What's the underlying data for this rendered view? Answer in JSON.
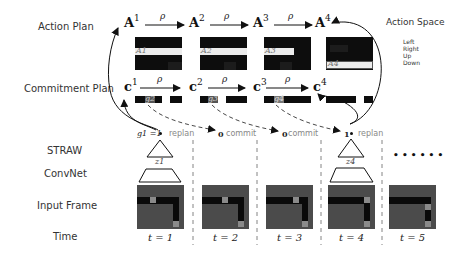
{
  "row_labels": {
    "action_plan": "Action Plan",
    "commitment_plan": "Commitment Plan",
    "straw": "STRAW",
    "convnet": "ConvNet",
    "input_frame": "Input Frame",
    "time": "Time"
  },
  "action_plan": {
    "nodes": [
      {
        "symbol": "A",
        "sup": "1",
        "block_label": "A1"
      },
      {
        "symbol": "A",
        "sup": "2",
        "block_label": "A2"
      },
      {
        "symbol": "A",
        "sup": "3",
        "block_label": "A3"
      },
      {
        "symbol": "A",
        "sup": "4",
        "block_label": "A4"
      }
    ],
    "transition_label": "ρ"
  },
  "commitment_plan": {
    "nodes": [
      {
        "symbol": "c",
        "sup": "1",
        "block_label": "g2"
      },
      {
        "symbol": "c",
        "sup": "2",
        "block_label": "g3"
      },
      {
        "symbol": "c",
        "sup": "3",
        "block_label": "g4"
      },
      {
        "symbol": "c",
        "sup": "4",
        "block_label": ""
      }
    ],
    "transition_label": "ρ"
  },
  "action_space": {
    "title": "Action Space",
    "items": [
      "Left",
      "Right",
      "Up",
      "Down"
    ]
  },
  "gates": [
    {
      "value": "g1 =1",
      "action": "replan"
    },
    {
      "value": "0",
      "action": "commit"
    },
    {
      "value": "0",
      "action": "commit"
    },
    {
      "value": "1",
      "action": "replan"
    }
  ],
  "straw_latents": [
    "z1",
    "z4"
  ],
  "continuation": "• • • • • •",
  "time_steps": [
    "t = 1",
    "t = 2",
    "t = 3",
    "t = 4",
    "t = 5"
  ],
  "colors": {
    "plan_block": "#0d0d0d",
    "plan_highlight": "#ececec",
    "frame_bg": "#4b4b4b",
    "frame_path": "#0a0a0a",
    "frame_cell": "#8a8a8a",
    "dashed": "#333333"
  }
}
